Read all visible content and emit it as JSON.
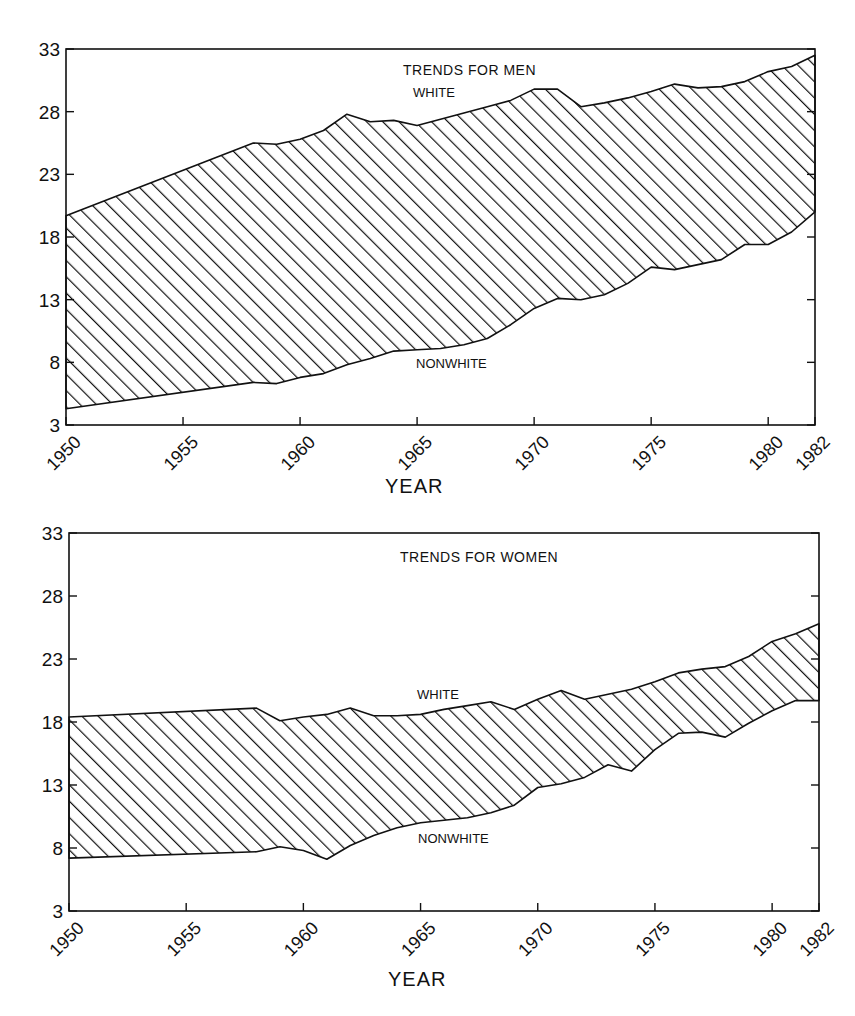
{
  "chart_data": [
    {
      "type": "area",
      "title": "TRENDS FOR MEN",
      "xlabel": "YEAR",
      "ylabel": "",
      "xlim": [
        1950,
        1982
      ],
      "ylim": [
        3,
        33
      ],
      "x_ticks": [
        "1950",
        "1955",
        "1960",
        "1965",
        "1970",
        "1975",
        "1980",
        "1982"
      ],
      "y_ticks": [
        "3",
        "8",
        "13",
        "18",
        "23",
        "28",
        "33"
      ],
      "grid": false,
      "fill": "diagonal hatching between series",
      "annotations": [
        "WHITE",
        "NONWHITE"
      ],
      "x": [
        1950,
        1958,
        1959,
        1960,
        1961,
        1962,
        1963,
        1964,
        1965,
        1966,
        1967,
        1968,
        1969,
        1970,
        1971,
        1972,
        1973,
        1974,
        1975,
        1976,
        1977,
        1978,
        1979,
        1980,
        1981,
        1982
      ],
      "series": [
        {
          "name": "WHITE",
          "values": [
            19.7,
            25.5,
            25.4,
            25.8,
            26.5,
            27.8,
            27.2,
            27.3,
            26.9,
            27.4,
            27.9,
            28.4,
            28.9,
            29.8,
            29.8,
            28.4,
            28.7,
            29.1,
            29.6,
            30.2,
            29.9,
            30.0,
            30.4,
            31.2,
            31.6,
            32.5
          ]
        },
        {
          "name": "NONWHITE",
          "values": [
            4.3,
            6.4,
            6.3,
            6.8,
            7.1,
            7.8,
            8.3,
            8.9,
            9.0,
            9.1,
            9.4,
            9.9,
            11.0,
            12.3,
            13.1,
            13.0,
            13.4,
            14.3,
            15.6,
            15.4,
            15.8,
            16.2,
            17.4,
            17.4,
            18.4,
            20.0
          ]
        }
      ]
    },
    {
      "type": "area",
      "title": "TRENDS FOR WOMEN",
      "xlabel": "YEAR",
      "ylabel": "",
      "xlim": [
        1950,
        1982
      ],
      "ylim": [
        3,
        33
      ],
      "x_ticks": [
        "1950",
        "1955",
        "1960",
        "1965",
        "1970",
        "1975",
        "1980",
        "1982"
      ],
      "y_ticks": [
        "3",
        "8",
        "13",
        "18",
        "23",
        "28",
        "33"
      ],
      "grid": false,
      "fill": "diagonal hatching between series",
      "annotations": [
        "WHITE",
        "NONWHITE"
      ],
      "x": [
        1950,
        1958,
        1959,
        1960,
        1961,
        1962,
        1963,
        1964,
        1965,
        1966,
        1967,
        1968,
        1969,
        1970,
        1971,
        1972,
        1973,
        1974,
        1975,
        1976,
        1977,
        1978,
        1979,
        1980,
        1981,
        1982
      ],
      "series": [
        {
          "name": "WHITE",
          "values": [
            18.4,
            19.1,
            18.1,
            18.4,
            18.6,
            19.1,
            18.5,
            18.5,
            18.6,
            19.0,
            19.3,
            19.6,
            19.0,
            19.8,
            20.5,
            19.8,
            20.2,
            20.6,
            21.2,
            21.9,
            22.2,
            22.4,
            23.2,
            24.4,
            25.0,
            25.8
          ]
        },
        {
          "name": "NONWHITE",
          "values": [
            7.2,
            7.7,
            8.1,
            7.8,
            7.1,
            8.2,
            9.0,
            9.6,
            10.0,
            10.2,
            10.4,
            10.8,
            11.4,
            12.8,
            13.1,
            13.6,
            14.6,
            14.1,
            15.8,
            17.1,
            17.2,
            16.8,
            17.9,
            18.9,
            19.7,
            19.7
          ]
        }
      ]
    }
  ],
  "charts": {
    "men": {
      "title": "TRENDS FOR MEN",
      "xlabel": "YEAR",
      "white_label": "WHITE",
      "nonwhite_label": "NONWHITE"
    },
    "women": {
      "title": "TRENDS FOR WOMEN",
      "xlabel": "YEAR",
      "white_label": "WHITE",
      "nonwhite_label": "NONWHITE"
    }
  }
}
